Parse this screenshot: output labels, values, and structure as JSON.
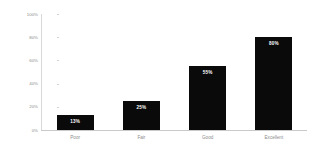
{
  "chart_data": {
    "type": "bar",
    "title": "",
    "subtitle": "",
    "xlabel": "",
    "ylabel": "Percent of respondents",
    "categories": [
      "Poor",
      "Fair",
      "Good",
      "Excellent"
    ],
    "values": [
      13,
      25,
      55,
      80
    ],
    "value_labels": [
      "13%",
      "25%",
      "55%",
      "80%"
    ],
    "ylim": [
      0,
      100
    ],
    "y_ticks": [
      0,
      20,
      40,
      60,
      80,
      100
    ],
    "y_tick_labels": [
      "0%",
      "20%",
      "40%",
      "60%",
      "80%",
      "100%"
    ],
    "grid": false,
    "legend": false,
    "legend_position": "none",
    "bar_color": "#0a0a0a",
    "value_label_color": "#ffffff",
    "axis_color": "#d2d2d2",
    "tick_label_color": "#8c8c8c",
    "background_color": "#ffffff"
  }
}
